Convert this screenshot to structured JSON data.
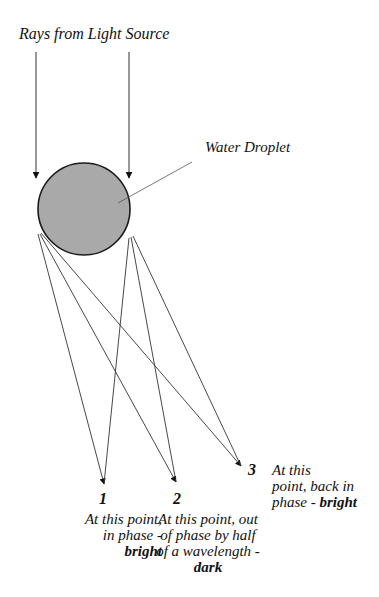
{
  "title": "Rays from Light Source",
  "droplet_label": "Water Droplet",
  "colors": {
    "droplet_fill": "#a9a9a9",
    "droplet_stroke": "#1a1a1a",
    "ray": "#333333"
  },
  "points": [
    {
      "number": "1",
      "lines": [
        "At this point,",
        "in phase -"
      ],
      "emphasis": "bright"
    },
    {
      "number": "2",
      "lines": [
        "At this point, out",
        "of phase by half",
        "of a wavelength -"
      ],
      "emphasis": "dark"
    },
    {
      "number": "3",
      "lines": [
        "At this",
        "point, back in",
        "phase - "
      ],
      "emphasis": "bright"
    }
  ]
}
